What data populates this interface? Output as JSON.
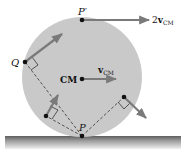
{
  "diagram": {
    "colors": {
      "disk_fill": "#c9c9c9",
      "vector": "#7a7a7a",
      "dot": "#111111",
      "dashed": "#333333",
      "ground_top": "#6e6e6e",
      "ground_bottom": "#e8e8e8"
    },
    "labels": {
      "p_prime": "P′",
      "two_v_cm_prefix": "2",
      "v_cm_v": "v",
      "v_cm_sub": "CM",
      "cm": "CM",
      "q": "Q",
      "p": "P"
    },
    "points": [
      {
        "name": "P-prime",
        "x": 82,
        "y": 20
      },
      {
        "name": "CM",
        "x": 82,
        "y": 79
      },
      {
        "name": "Q",
        "x": 25,
        "y": 62
      },
      {
        "name": "P",
        "x": 82,
        "y": 136
      },
      {
        "name": "lower-left",
        "x": 46,
        "y": 116
      },
      {
        "name": "right",
        "x": 124,
        "y": 97
      }
    ]
  }
}
